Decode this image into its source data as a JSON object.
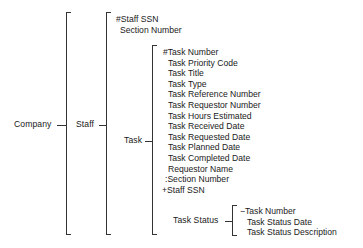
{
  "diagram": {
    "type": "data-structure-bracket-hierarchy",
    "root": {
      "label": "Company"
    },
    "staff": {
      "label": "Staff",
      "attributes": [
        "#Staff SSN",
        " Section Number"
      ]
    },
    "task": {
      "label": "Task",
      "attributes": [
        "#Task Number",
        " Task Priority Code",
        " Task Title",
        " Task Type",
        " Task Reference Number",
        " Task Requestor Number",
        " Task Hours Estimated",
        " Task Received Date",
        " Task Requested Date",
        " Task Planned Date",
        " Task Completed Date",
        " Requestor Name",
        ":Section Number",
        "+Staff SSN"
      ]
    },
    "task_status": {
      "label": "Task Status",
      "attributes": [
        "−Task Number",
        " Task Status Date",
        " Task Status Description"
      ]
    },
    "line_color": "#333333"
  }
}
